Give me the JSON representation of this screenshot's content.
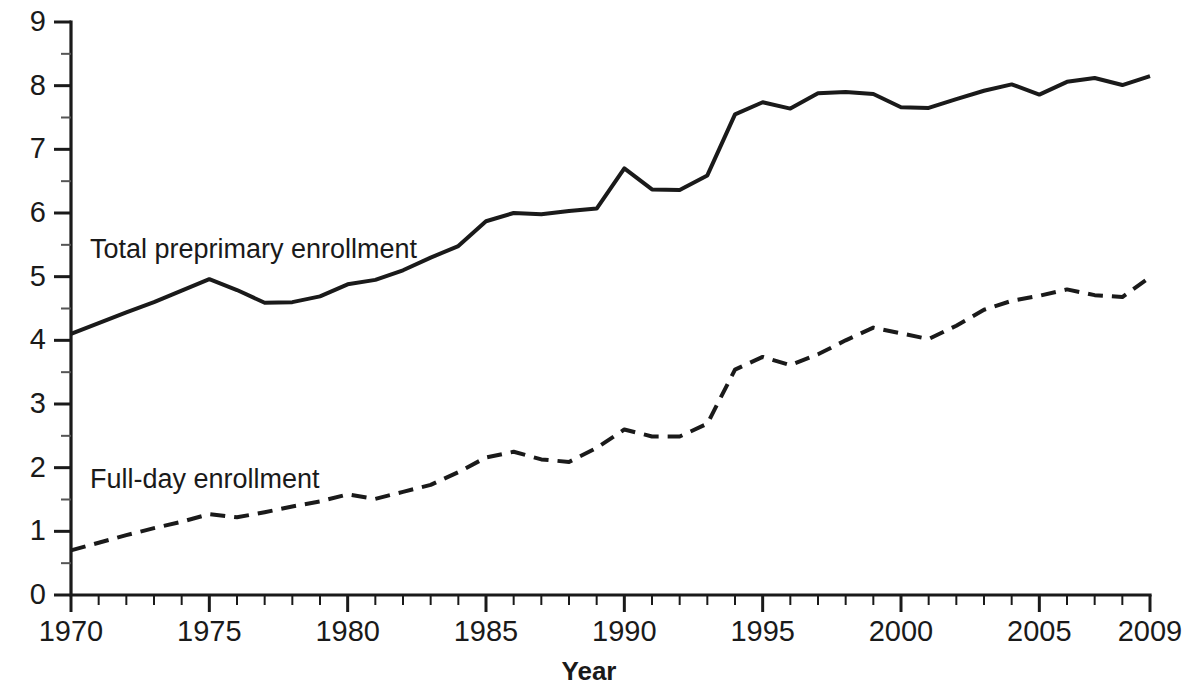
{
  "chart_data": {
    "type": "line",
    "title": "",
    "xlabel": "Year",
    "ylabel": "",
    "xlim": [
      1970,
      2009
    ],
    "ylim": [
      0,
      9
    ],
    "grid": false,
    "legend_position": "inline-annotation",
    "x": [
      1970,
      1971,
      1972,
      1973,
      1974,
      1975,
      1976,
      1977,
      1978,
      1979,
      1980,
      1981,
      1982,
      1983,
      1984,
      1985,
      1986,
      1987,
      1988,
      1989,
      1990,
      1991,
      1992,
      1993,
      1994,
      1995,
      1996,
      1997,
      1998,
      1999,
      2000,
      2001,
      2002,
      2003,
      2004,
      2005,
      2006,
      2007,
      2008,
      2009
    ],
    "series": [
      {
        "name": "Total preprimary enrollment",
        "style": "solid",
        "color": "#1a1a1a",
        "values": [
          4.1,
          4.27,
          4.44,
          4.6,
          4.78,
          4.96,
          4.79,
          4.59,
          4.6,
          4.69,
          4.88,
          4.95,
          5.1,
          5.3,
          5.48,
          5.87,
          6.0,
          5.98,
          6.03,
          6.07,
          6.7,
          6.37,
          6.36,
          6.59,
          7.55,
          7.74,
          7.64,
          7.88,
          7.9,
          7.87,
          7.66,
          7.65,
          7.79,
          7.92,
          8.02,
          7.86,
          8.06,
          8.12,
          8.01,
          8.15
        ]
      },
      {
        "name": "Full-day enrollment",
        "style": "dashed",
        "color": "#1a1a1a",
        "values": [
          0.7,
          0.82,
          0.94,
          1.05,
          1.15,
          1.27,
          1.22,
          1.3,
          1.39,
          1.47,
          1.58,
          1.51,
          1.62,
          1.73,
          1.93,
          2.16,
          2.25,
          2.13,
          2.09,
          2.31,
          2.6,
          2.49,
          2.49,
          2.69,
          3.54,
          3.74,
          3.61,
          3.78,
          4.0,
          4.2,
          4.11,
          4.02,
          4.23,
          4.48,
          4.62,
          4.7,
          4.8,
          4.71,
          4.68,
          4.99
        ]
      }
    ],
    "y_ticks_major": [
      0,
      1,
      2,
      3,
      4,
      5,
      6,
      7,
      8,
      9
    ],
    "y_tick_labels": [
      "0",
      "1",
      "2",
      "3",
      "4",
      "5",
      "6",
      "7",
      "8",
      "9"
    ],
    "y_ticks_minor": [
      0.5,
      1.5,
      2.5,
      3.5,
      4.5,
      5.5,
      6.5,
      7.5,
      8.5
    ],
    "x_ticks_major": [
      1970,
      1975,
      1980,
      1985,
      1990,
      1995,
      2000,
      2005,
      2009
    ],
    "x_tick_labels": [
      "1970",
      "1975",
      "1980",
      "1985",
      "1990",
      "1995",
      "2000",
      "2005",
      "2009"
    ],
    "annotations": [
      {
        "text": "Total preprimary enrollment",
        "x_px": 90,
        "y_px": 236
      },
      {
        "text": "Full-day enrollment",
        "x_px": 90,
        "y_px": 466
      }
    ]
  },
  "axis": {
    "x_title": "Year"
  }
}
